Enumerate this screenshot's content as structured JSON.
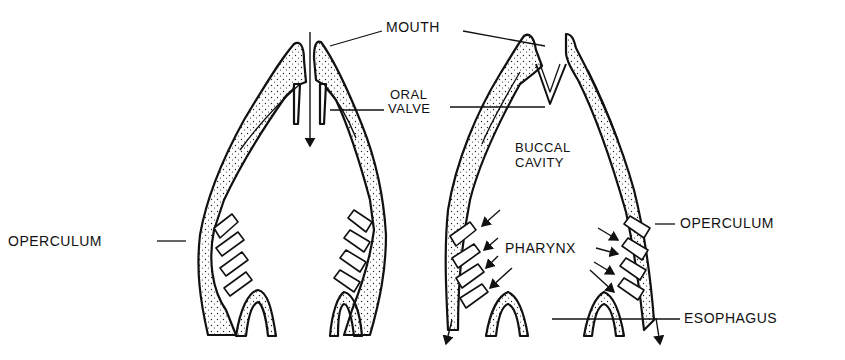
{
  "figure": {
    "panels": [
      {
        "name": "left",
        "state": "mouth open, water entering, oral valve open"
      },
      {
        "name": "right",
        "state": "mouth closed, oral valve closed, water passing over gills"
      }
    ]
  },
  "labels": {
    "mouth": "MOUTH",
    "oral_valve_line1": "ORAL",
    "oral_valve_line2": "VALVE",
    "buccal_line1": "BUCCAL",
    "buccal_line2": "CAVITY",
    "operculum_left": "OPERCULUM",
    "operculum_right": "OPERCULUM",
    "pharynx": "PHARYNX",
    "esophagus": "ESOPHAGUS"
  },
  "colors": {
    "ink": "#111111",
    "background": "#ffffff"
  }
}
